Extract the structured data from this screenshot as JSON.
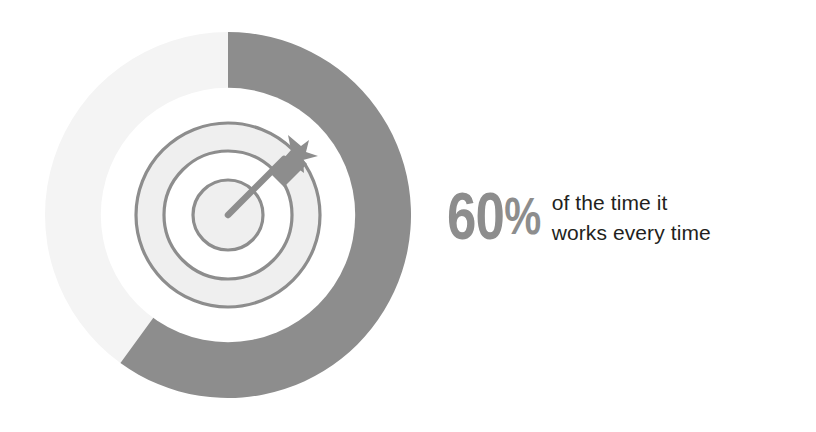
{
  "figure": {
    "background_color": "#ffffff",
    "stat": {
      "number": "60",
      "percent_sign": "%",
      "full_value": "60%",
      "value_color": "#8d8d8d"
    },
    "caption": {
      "line1": "of the time it",
      "line2": "works every time",
      "color": "#231f20"
    },
    "icon": {
      "name": "target-with-dart-icon",
      "ring_stroke_color": "#8d8d8d",
      "ring_fill_color": "#efefef",
      "dart_color": "#8d8d8d"
    }
  },
  "chart_data": {
    "type": "pie",
    "title": "",
    "subtitle": "",
    "variant": "donut",
    "start_angle_deg": 0,
    "direction": "clockwise",
    "inner_radius_ratio": 0.695,
    "legend": "none",
    "grid": false,
    "labels": [
      "Works",
      "Does not work"
    ],
    "values": [
      60,
      40
    ],
    "value_unit": "%",
    "colors": [
      "#8d8d8d",
      "#f4f4f4"
    ],
    "annotations": [
      "60% of the time it works every time"
    ],
    "slices": [
      {
        "label": "Works",
        "value": 60,
        "color": "#8d8d8d",
        "sweep_deg": 216
      },
      {
        "label": "Does not work",
        "value": 40,
        "color": "#f4f4f4",
        "sweep_deg": 144
      }
    ]
  }
}
